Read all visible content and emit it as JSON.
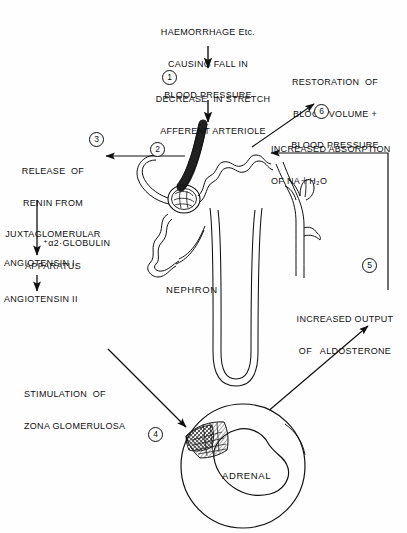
{
  "diagram": {
    "ink_color": "#101010",
    "background_color": "#fefefe"
  },
  "nodes": {
    "haemorrhage": {
      "lines": [
        "HAEMORRHAGE Etc.",
        "CAUSING FALL IN",
        "BLOOD PRESSURE"
      ]
    },
    "decrease_stretch": {
      "lines": [
        "DECREASE  IN STRETCH",
        "AFFERENT ARTERIOLE"
      ],
      "marker": "1"
    },
    "renin_release": {
      "lines": [
        "RELEASE  OF",
        "RENIN FROM",
        "JUXTAGLOMERULAR",
        "APPARATUS"
      ],
      "marker": "3"
    },
    "jg_apparatus_marker": {
      "marker": "2"
    },
    "globulin": {
      "text": "⁺α2·GLOBULIN"
    },
    "angiotensin_1": {
      "text": "ANGIOTENSIN I."
    },
    "angiotensin_2": {
      "text": "ANGIOTENSIN II"
    },
    "stimulation_zona": {
      "lines": [
        "STIMULATION  OF",
        "ZONA GLOMERULOSA"
      ],
      "marker": "4"
    },
    "adrenal": {
      "label": "ADRENAL"
    },
    "nephron": {
      "label": "NEPHRON"
    },
    "aldosterone_output": {
      "lines": [
        "INCREASED OUTPUT",
        "OF   ALDOSTERONE"
      ],
      "marker": "5"
    },
    "increased_absorption": {
      "lines": [
        "INCREASED ABSORPTION",
        "OF NA＋H₂O"
      ],
      "marker": "6"
    },
    "restoration": {
      "lines": [
        "RESTORATION  OF",
        "BLOOD VOLUME +",
        "BLOOD PRESSURE"
      ]
    }
  },
  "markers": {
    "one": "1",
    "two": "2",
    "three": "3",
    "four": "4",
    "five": "5",
    "six": "6"
  }
}
